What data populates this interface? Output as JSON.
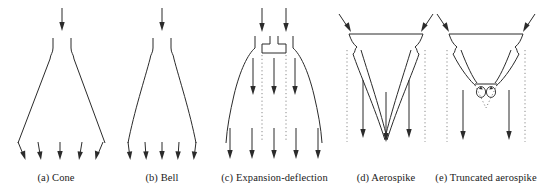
{
  "figure": {
    "background": "#ffffff",
    "line_color": "#2b2b2b",
    "dotted_color": "#8a8a8a",
    "panel_count": 5
  },
  "panels": [
    {
      "id": "cone",
      "label": "(a) Cone",
      "inlet_arrows": 1,
      "exit_arrows": 5,
      "exit_flow": "divergent",
      "wall_shape": "straight-conical"
    },
    {
      "id": "bell",
      "label": "(b) Bell",
      "inlet_arrows": 1,
      "exit_arrows": 5,
      "exit_flow": "near-axial",
      "wall_shape": "bell-contour"
    },
    {
      "id": "expansion-deflection",
      "label": "(c) Expansion-deflection",
      "inlet_arrows": 2,
      "exit_arrows": 5,
      "exit_flow": "axial",
      "wall_shape": "curved-outer-shroud",
      "has_center_plug": true,
      "has_dotted_boundary": true,
      "internal_arrows": 4
    },
    {
      "id": "aerospike",
      "label": "(d) Aerospike",
      "inlet_arrows": 2,
      "exit_arrows": 3,
      "exit_flow": "axial",
      "wall_shape": "full-central-spike",
      "has_dotted_boundary": true
    },
    {
      "id": "truncated-aerospike",
      "label": "(e) Truncated aerospike",
      "inlet_arrows": 2,
      "exit_arrows": 2,
      "exit_flow": "axial",
      "wall_shape": "truncated-central-spike",
      "has_dotted_boundary": true,
      "has_recirculation_zone": true,
      "recirculation_vortices": 2
    }
  ]
}
